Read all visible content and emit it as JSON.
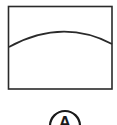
{
  "diagram": {
    "frame": {
      "shape": "rectangle",
      "stroke": "#2a2a2a"
    },
    "curve": {
      "shape": "convex-arc",
      "stroke": "#2a2a2a"
    },
    "label": {
      "text": "A",
      "shape": "circle",
      "stroke": "#1a1a1a"
    }
  }
}
